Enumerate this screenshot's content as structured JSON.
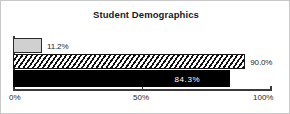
{
  "chart_data": {
    "type": "bar",
    "orientation": "horizontal",
    "title": "Student Demographics",
    "xlabel": "",
    "ylabel": "",
    "xlim": [
      0,
      100
    ],
    "grid": false,
    "legend": null,
    "tick_labels": [
      "0%",
      "50%",
      "100%"
    ],
    "tick_values": [
      0,
      50,
      100
    ],
    "categories": [
      "Series 1",
      "Series 2",
      "Series 3"
    ],
    "values": [
      11.2,
      90.0,
      84.3
    ],
    "data_labels": [
      "11.2%",
      "90.0%",
      "84.3%"
    ],
    "bars": [
      {
        "value": 11.2,
        "label": "11.2%",
        "style": "solid-gray",
        "label_position": "outside"
      },
      {
        "value": 90.0,
        "label": "90.0%",
        "style": "diagonal-hatch",
        "label_position": "outside"
      },
      {
        "value": 84.3,
        "label": "84.3%",
        "style": "solid-black",
        "label_position": "inside"
      }
    ]
  },
  "colors": {
    "bar_gray": "#d0d0d0",
    "bar_black": "#000000",
    "hatch_line": "#111111",
    "axis": "#3a3a3a",
    "text": "#1f1f1f",
    "frame_border": "#c8c8c8",
    "background": "#ffffff"
  }
}
